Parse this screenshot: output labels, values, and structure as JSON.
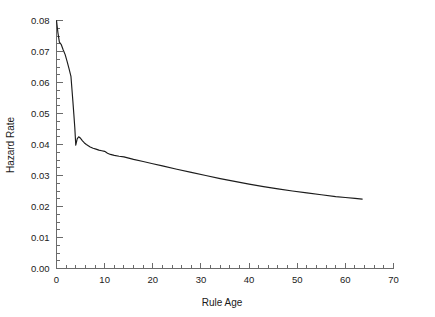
{
  "chart_data": {
    "type": "line",
    "title": "",
    "xlabel": "Rule Age",
    "ylabel": "Hazard Rate",
    "xlim": [
      0,
      70
    ],
    "ylim": [
      0.0,
      0.08
    ],
    "grid": false,
    "legend": null,
    "x_ticks": [
      0,
      10,
      20,
      30,
      40,
      50,
      60,
      70
    ],
    "x_tick_labels": [
      "0",
      "10",
      "20",
      "30",
      "40",
      "50",
      "60",
      "70"
    ],
    "x_minor_tick_step": 2,
    "y_ticks": [
      0.0,
      0.01,
      0.02,
      0.03,
      0.04,
      0.05,
      0.06,
      0.07,
      0.08
    ],
    "y_tick_labels": [
      "0.00",
      "0.01",
      "0.02",
      "0.03",
      "0.04",
      "0.05",
      "0.06",
      "0.07",
      "0.08"
    ],
    "y_minor_tick_step": 0.0025,
    "series": [
      {
        "name": "Hazard Rate",
        "color": "#1c1c1c",
        "x": [
          0.0,
          0.3,
          0.6,
          1.0,
          1.4,
          1.8,
          2.2,
          2.6,
          3.0,
          3.2,
          3.4,
          3.6,
          3.8,
          4.0,
          4.3,
          4.6,
          5.0,
          5.4,
          5.8,
          6.2,
          6.6,
          7.0,
          7.6,
          8.2,
          8.8,
          9.4,
          10.0,
          10.6,
          11.2,
          12.0,
          13.0,
          14.0,
          16.0,
          18.0,
          20.0,
          22.0,
          25.0,
          28.0,
          31.0,
          34.0,
          37.0,
          40.0,
          43.0,
          46.0,
          49.0,
          52.0,
          55.0,
          58.0,
          60.0,
          62.0,
          63.5
        ],
        "y": [
          0.08,
          0.076,
          0.073,
          0.0722,
          0.0705,
          0.069,
          0.0668,
          0.0645,
          0.062,
          0.058,
          0.054,
          0.0498,
          0.0455,
          0.0398,
          0.0418,
          0.0425,
          0.042,
          0.0412,
          0.0405,
          0.04,
          0.0396,
          0.0392,
          0.0388,
          0.0385,
          0.0382,
          0.038,
          0.0378,
          0.0372,
          0.0368,
          0.0365,
          0.0362,
          0.036,
          0.0352,
          0.0345,
          0.0338,
          0.0331,
          0.032,
          0.031,
          0.03,
          0.029,
          0.0281,
          0.0272,
          0.0264,
          0.0257,
          0.025,
          0.0244,
          0.0238,
          0.0232,
          0.0229,
          0.0226,
          0.0224
        ]
      }
    ]
  },
  "axes": {
    "x_title": "Rule Age",
    "y_title": "Hazard Rate"
  }
}
